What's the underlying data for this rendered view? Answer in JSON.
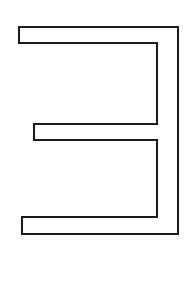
{
  "figure": {
    "width": 194,
    "height": 289,
    "background": "#ffffff",
    "stroke_color": "#1a1a1a",
    "stroke_width": 2,
    "outline_points": "19,27 178,27 178,234 22,234 22,217 157,217 157,140 34,140 34,124 157,124 157,43 19,43"
  }
}
